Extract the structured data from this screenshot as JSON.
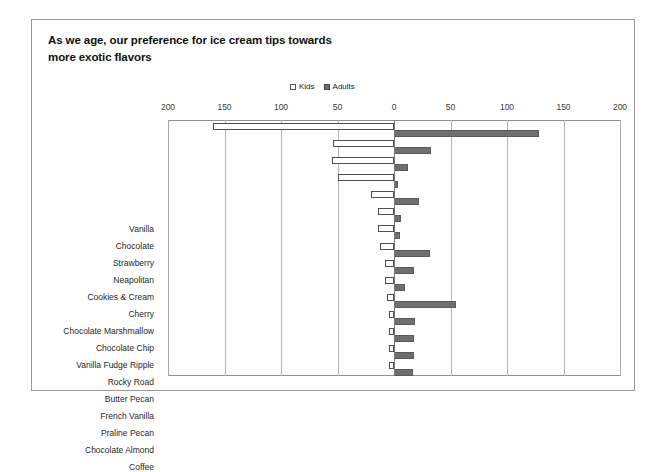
{
  "chart_data": {
    "type": "bar",
    "orientation": "horizontal-diverging",
    "title": "As we age, our preference for ice cream tips towards\nmore exotic flavors",
    "xlabel": "",
    "ylabel": "",
    "xlim": [
      -200,
      200
    ],
    "x_ticks": [
      -200,
      -150,
      -100,
      -50,
      0,
      50,
      100,
      150,
      200
    ],
    "x_tick_labels": [
      "200",
      "150",
      "100",
      "50",
      "0",
      "50",
      "100",
      "150",
      "200"
    ],
    "grid": true,
    "legend_position": "top-right",
    "categories": [
      "Vanilla",
      "Chocolate",
      "Strawberry",
      "Neapolitan",
      "Cookies & Cream",
      "Cherry",
      "Chocolate Marshmallow",
      "Chocolate Chip",
      "Vanilla Fudge Ripple",
      "Rocky Road",
      "Butter Pecan",
      "French Vanilla",
      "Praline Pecan",
      "Chocolate Almond",
      "Coffee"
    ],
    "series": [
      {
        "name": "Kids",
        "direction": "left",
        "color": "#ffffff",
        "border_color": "#4d4d4d",
        "values": [
          160,
          54,
          55,
          50,
          20,
          14,
          14,
          12,
          8,
          8,
          6,
          4,
          4,
          4,
          4
        ]
      },
      {
        "name": "Adults",
        "direction": "right",
        "color": "#6f6f6f",
        "border_color": "#5a5a5a",
        "values": [
          128,
          33,
          12,
          3,
          22,
          6,
          5,
          32,
          18,
          10,
          55,
          19,
          18,
          18,
          17
        ]
      }
    ]
  },
  "legend": {
    "items": [
      {
        "label": "Kids",
        "swatch": "hollow-square"
      },
      {
        "label": "Adults",
        "swatch": "filled-square"
      }
    ]
  }
}
